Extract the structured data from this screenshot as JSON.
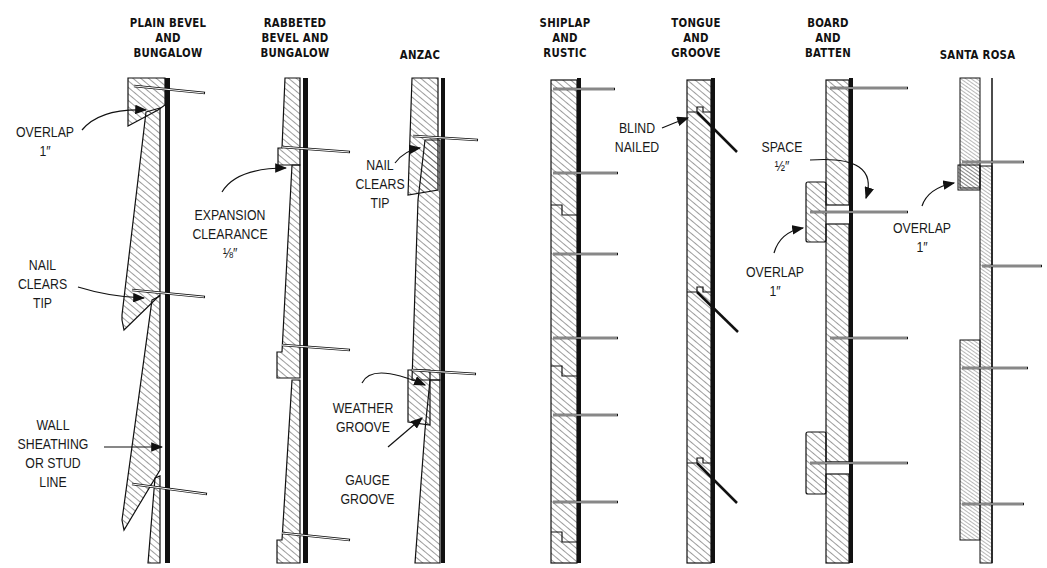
{
  "diagram": {
    "columns": [
      {
        "id": "plain-bevel",
        "title": "PLAIN BEVEL\nAND\nBUNGALOW"
      },
      {
        "id": "rabbeted-bevel",
        "title": "RABBETED\nBEVEL AND\nBUNGALOW"
      },
      {
        "id": "anzac",
        "title": "ANZAC"
      },
      {
        "id": "shiplap",
        "title": "SHIPLAP\nAND\nRUSTIC"
      },
      {
        "id": "tongue-groove",
        "title": "TONGUE\nAND\nGROOVE"
      },
      {
        "id": "board-batten",
        "title": "BOARD\nAND\nBATTEN"
      },
      {
        "id": "santa-rosa",
        "title": "SANTA ROSA"
      }
    ],
    "annotations": {
      "overlap_plain": "OVERLAP\n1″",
      "nail_clears_plain": "NAIL\nCLEARS\nTIP",
      "wall_sheathing": "WALL\nSHEATHING\nOR STUD\nLINE",
      "expansion_clearance": "EXPANSION\nCLEARANCE\n⅛″",
      "nail_clears_anzac": "NAIL\nCLEARS\nTIP",
      "weather_groove": "WEATHER\nGROOVE",
      "gauge_groove": "GAUGE\nGROOVE",
      "blind_nailed": "BLIND\nNAILED",
      "space": "SPACE\n½″",
      "overlap_batten": "OVERLAP\n1″",
      "overlap_santa_rosa": "OVERLAP\n1″"
    },
    "colors": {
      "ink": "#111111",
      "paper": "#ffffff"
    }
  }
}
